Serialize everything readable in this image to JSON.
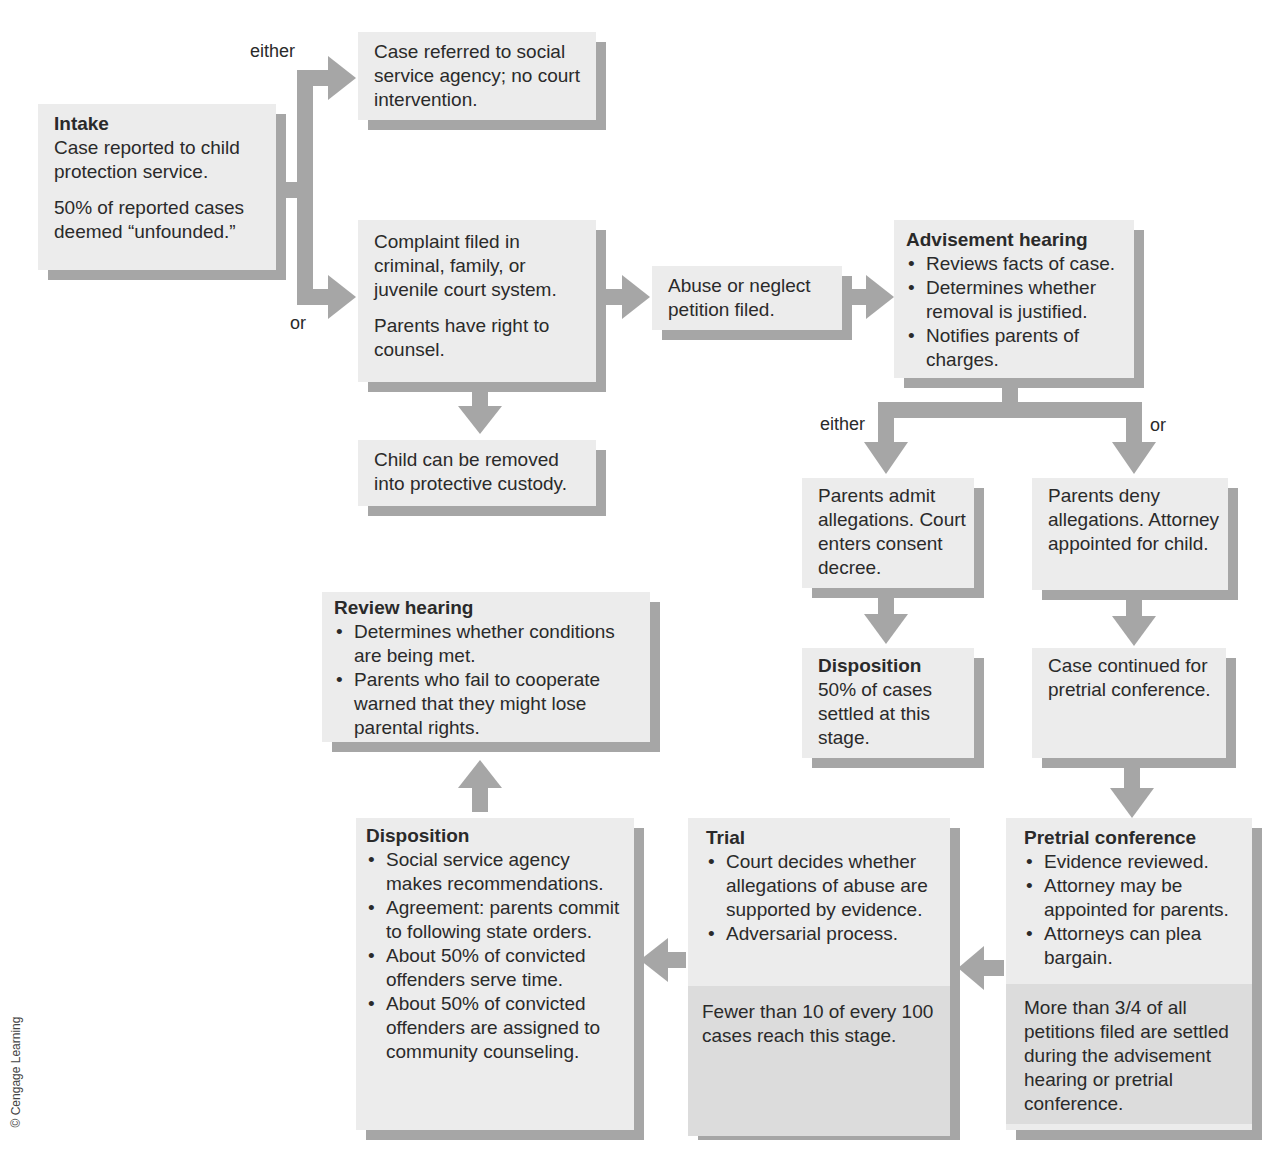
{
  "diagram": {
    "type": "flowchart",
    "credit": "© Cengage Learning",
    "connector_color": "#a6a6a6",
    "box_color": "#ececec",
    "note_color": "#dcdcdc"
  },
  "labels": {
    "either_1": "either",
    "or_1": "or",
    "either_2": "either",
    "or_2": "or"
  },
  "nodes": {
    "intake": {
      "title": "Intake",
      "text": "Case reported to child protection service.",
      "note": "50% of reported cases deemed “unfounded.”"
    },
    "social_service": {
      "text": "Case referred to social service agency; no court intervention."
    },
    "complaint": {
      "text": "Complaint filed in criminal, family, or juvenile court system.",
      "note": "Parents have right to counsel."
    },
    "custody": {
      "text": "Child can be removed into protective custody."
    },
    "petition": {
      "text": "Abuse or neglect petition filed."
    },
    "advisement": {
      "title": "Advisement hearing",
      "bullets": [
        "Reviews facts of case.",
        "Determines whether removal is justified.",
        "Notifies parents of charges."
      ]
    },
    "admit": {
      "text": "Parents admit allegations. Court enters consent decree."
    },
    "deny": {
      "text": "Parents deny allegations. Attorney appointed for child."
    },
    "disposition_early": {
      "title": "Disposition",
      "text": "50% of cases settled at this stage."
    },
    "continued": {
      "text": "Case continued for pretrial conference."
    },
    "pretrial": {
      "title": "Pretrial conference",
      "bullets": [
        "Evidence reviewed.",
        "Attorney may be appointed for parents.",
        "Attorneys can plea bargain."
      ],
      "note": "More than 3/4 of all petitions filed are settled during the advisement hearing or pretrial conference."
    },
    "trial": {
      "title": "Trial",
      "bullets": [
        "Court decides whether allegations of abuse are supported by evidence.",
        "Adversarial process."
      ],
      "note": "Fewer than 10 of every 100 cases reach this stage."
    },
    "disposition_final": {
      "title": "Disposition",
      "bullets": [
        "Social service agency makes recommendations.",
        "Agreement: parents commit to following state orders.",
        "About 50% of convicted offenders serve time.",
        "About 50% of convicted offenders are assigned to community counseling."
      ]
    },
    "review": {
      "title": "Review hearing",
      "bullets": [
        "Determines whether conditions are being met.",
        "Parents who fail to cooperate warned that they might lose parental rights."
      ]
    }
  },
  "edges": [
    {
      "from": "intake",
      "to": "social_service",
      "label": "either"
    },
    {
      "from": "intake",
      "to": "complaint",
      "label": "or"
    },
    {
      "from": "complaint",
      "to": "custody"
    },
    {
      "from": "complaint",
      "to": "petition"
    },
    {
      "from": "petition",
      "to": "advisement"
    },
    {
      "from": "advisement",
      "to": "admit",
      "label": "either"
    },
    {
      "from": "advisement",
      "to": "deny",
      "label": "or"
    },
    {
      "from": "admit",
      "to": "disposition_early"
    },
    {
      "from": "deny",
      "to": "continued"
    },
    {
      "from": "continued",
      "to": "pretrial"
    },
    {
      "from": "pretrial",
      "to": "trial"
    },
    {
      "from": "trial",
      "to": "disposition_final"
    },
    {
      "from": "disposition_final",
      "to": "review"
    }
  ]
}
